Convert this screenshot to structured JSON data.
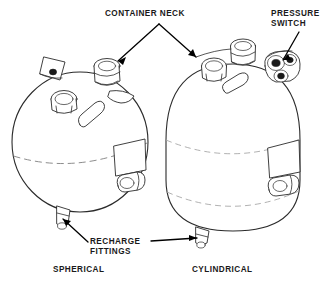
{
  "figure": {
    "title": "",
    "background_color": "#ffffff",
    "line_color": "#2b2b2b",
    "seam_color": "#8d8d8d",
    "leader_color": "#000000"
  },
  "labels": {
    "container_neck": "CONTAINER NECK",
    "pressure_switch_line1": "PRESSURE",
    "pressure_switch_line2": "SWITCH",
    "recharge_line1": "RECHARGE",
    "recharge_line2": "FITTINGS"
  },
  "captions": {
    "spherical": "SPHERICAL",
    "cylindrical": "CYLINDRICAL"
  },
  "parts": [
    {
      "id": "spherical-container",
      "name": "Spherical container",
      "caption": "SPHERICAL",
      "features": [
        "mounting-bracket",
        "round-port",
        "container-neck",
        "oval-port",
        "label-plate",
        "side-fitting",
        "weld-seam",
        "recharge-fitting"
      ]
    },
    {
      "id": "cylindrical-container",
      "name": "Cylindrical container",
      "caption": "CYLINDRICAL",
      "features": [
        "round-port",
        "container-neck",
        "pressure-switch",
        "oval-port",
        "label-plate",
        "side-fitting",
        "upper-weld-seam",
        "lower-weld-seam",
        "recharge-fitting"
      ]
    }
  ]
}
